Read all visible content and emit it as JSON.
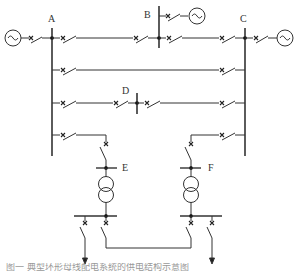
{
  "diagram": {
    "nodes": [
      {
        "id": "A",
        "label": "A",
        "type": "busbar"
      },
      {
        "id": "B",
        "label": "B",
        "type": "busbar"
      },
      {
        "id": "C",
        "label": "C",
        "type": "busbar"
      },
      {
        "id": "D",
        "label": "D",
        "type": "busbar"
      },
      {
        "id": "E",
        "label": "E",
        "type": "transformer-bus"
      },
      {
        "id": "F",
        "label": "F",
        "type": "transformer-bus"
      }
    ],
    "sources": [
      {
        "id": "gen-left",
        "symbol": "~",
        "connects": "A"
      },
      {
        "id": "gen-top",
        "symbol": "~",
        "connects": "B"
      },
      {
        "id": "gen-right",
        "symbol": "~",
        "connects": "C"
      }
    ],
    "edges": [
      {
        "from": "A",
        "to": "B",
        "via": "breaker"
      },
      {
        "from": "B",
        "to": "C",
        "via": "breaker"
      },
      {
        "from": "A",
        "to": "C",
        "via": "breaker"
      },
      {
        "from": "A",
        "to": "D",
        "via": "breaker"
      },
      {
        "from": "D",
        "to": "C",
        "via": "breaker"
      },
      {
        "from": "A",
        "to": "E",
        "via": "breaker"
      },
      {
        "from": "C",
        "to": "F",
        "via": "breaker"
      },
      {
        "from": "E-low",
        "to": "F-low",
        "via": "breaker-tie"
      }
    ],
    "outputs": [
      {
        "from": "E-low",
        "symbol": "arrow-down"
      },
      {
        "from": "F-low",
        "symbol": "arrow-down"
      }
    ]
  },
  "labels": {
    "A": "A",
    "B": "B",
    "C": "C",
    "D": "D",
    "E": "E",
    "F": "F",
    "gen": "~"
  },
  "caption": "图一    典型环形母线配电系统的供电结构示意图"
}
